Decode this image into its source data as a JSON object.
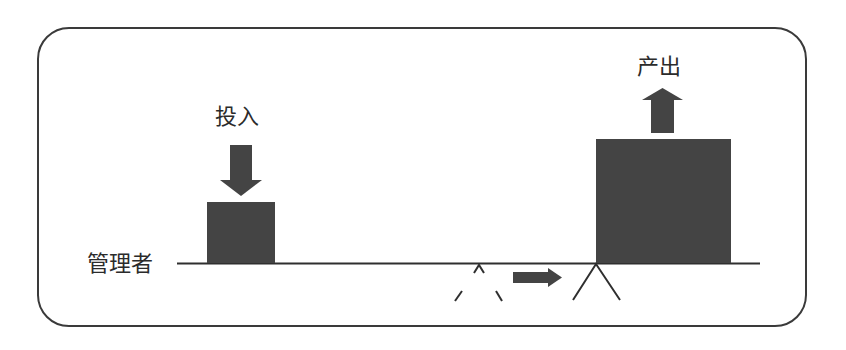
{
  "diagram": {
    "type": "lever-balance",
    "labels": {
      "input": "投入",
      "output": "产出",
      "manager": "管理者"
    },
    "colors": {
      "block_fill": "#444444",
      "line": "#2f2f2f",
      "frame": "#3a3a3a",
      "text": "#2b2b2b"
    },
    "elements": {
      "input_block": {
        "description": "small block representing input",
        "relative_size": "small"
      },
      "output_block": {
        "description": "large block representing output",
        "relative_size": "large"
      },
      "input_arrow": {
        "direction": "down"
      },
      "output_arrow": {
        "direction": "up"
      },
      "fulcrum_old": {
        "style": "dashed",
        "position": "center"
      },
      "fulcrum_new": {
        "style": "solid",
        "position": "under output block"
      },
      "shift_arrow": {
        "direction": "right"
      }
    }
  }
}
